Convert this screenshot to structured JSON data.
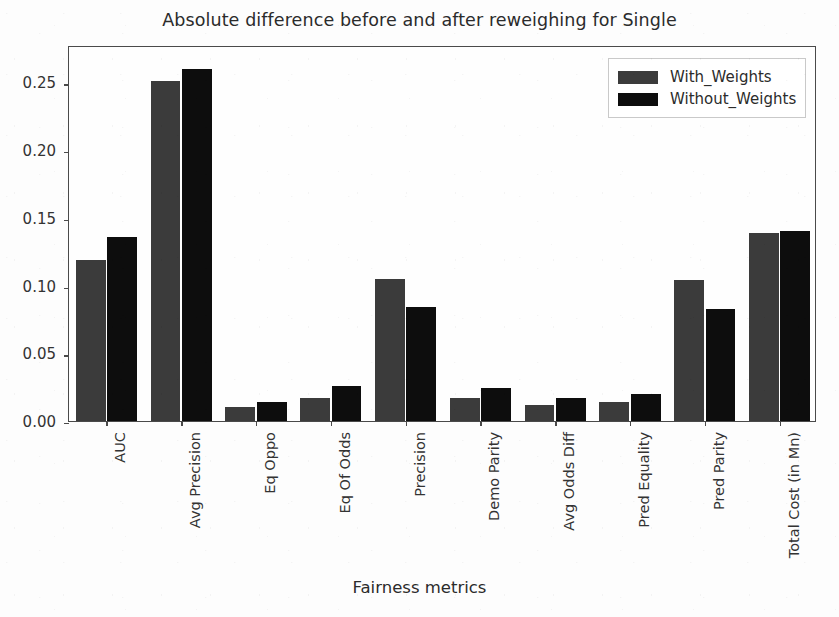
{
  "chart_data": {
    "type": "bar",
    "title": "Absolute difference before and after reweighing for Single",
    "xlabel": "Fairness metrics",
    "ylabel": "",
    "categories": [
      "AUC",
      "Avg Precision",
      "Eq Oppo",
      "Eq Of Odds",
      "Precision",
      "Demo Parity",
      "Avg Odds Diff",
      "Pred Equality",
      "Pred Parity",
      "Total Cost (in Mn)"
    ],
    "series": [
      {
        "name": "With_Weights",
        "color": "#3b3b3b",
        "values": [
          0.119,
          0.251,
          0.01,
          0.017,
          0.105,
          0.017,
          0.012,
          0.014,
          0.104,
          0.139
        ]
      },
      {
        "name": "Without_Weights",
        "color": "#0d0d0d",
        "values": [
          0.136,
          0.26,
          0.014,
          0.026,
          0.084,
          0.024,
          0.017,
          0.02,
          0.083,
          0.14
        ]
      }
    ],
    "ylim": [
      0.0,
      0.2775
    ],
    "yticks": [
      0.0,
      0.05,
      0.1,
      0.15,
      0.2,
      0.25
    ],
    "ytick_labels": [
      "0.00",
      "0.05",
      "0.10",
      "0.15",
      "0.20",
      "0.25"
    ],
    "grid": false,
    "legend_position": "upper right"
  },
  "legend": {
    "entries": [
      {
        "label": "With_Weights"
      },
      {
        "label": "Without_Weights"
      }
    ]
  }
}
